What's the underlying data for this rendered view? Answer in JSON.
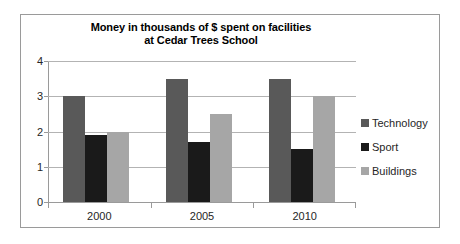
{
  "chart_data": {
    "type": "bar",
    "title": "Money in thousands of $ spent on facilities at Cedar Trees School",
    "title_line1": "Money in thousands of $ spent on facilities",
    "title_line2": "at Cedar Trees School",
    "xlabel": "",
    "ylabel": "",
    "categories": [
      "2000",
      "2005",
      "2010"
    ],
    "series": [
      {
        "name": "Technology",
        "color": "#595959",
        "values": [
          3.0,
          3.5,
          3.5
        ]
      },
      {
        "name": "Sport",
        "color": "#1a1a1a",
        "values": [
          1.9,
          1.7,
          1.5
        ]
      },
      {
        "name": "Buildings",
        "color": "#a6a6a6",
        "values": [
          2.0,
          2.5,
          3.0
        ]
      }
    ],
    "ylim": [
      0,
      4
    ],
    "yticks": [
      0,
      1,
      2,
      3,
      4
    ],
    "ytick_labels": [
      "0",
      "1",
      "2",
      "3",
      "4"
    ],
    "grid": true,
    "legend_position": "right",
    "gridline_color": "#b3b3b3",
    "axis_color": "#9a9a9a",
    "background": "#ffffff"
  }
}
